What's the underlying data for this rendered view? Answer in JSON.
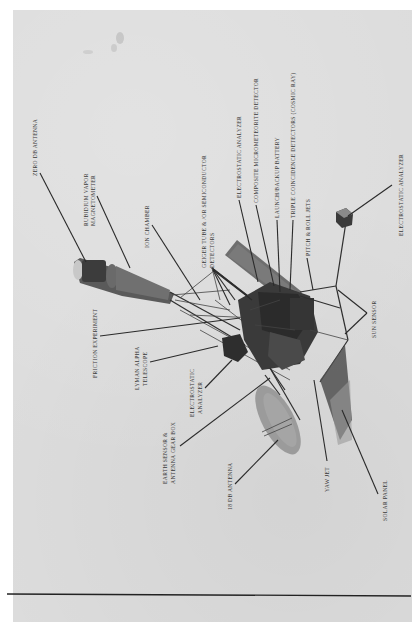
{
  "figure": {
    "orientation": "rotated-90-ccw",
    "labels": [
      {
        "id": "zero-db-antenna",
        "text": "ZERO DB ANTENNA"
      },
      {
        "id": "rubidium-magnetometer",
        "text": "RUBIDIUM VAPOR",
        "text2": "MAGNETOMETER"
      },
      {
        "id": "ion-chamber",
        "text": "ION CHAMBER"
      },
      {
        "id": "geiger-tube",
        "text": "GEIGER TUBE & /OR SEMICONDUCTOR",
        "text2": "DETECTORS"
      },
      {
        "id": "electrostatic-analyzer-1",
        "text": "ELECTROSTATIC ANALYZER"
      },
      {
        "id": "micrometeorite-detector",
        "text": "COMPOSITE MICROMETEORITE DETECTOR"
      },
      {
        "id": "backup-battery",
        "text": "LAUNCH/BACKUP BATTERY"
      },
      {
        "id": "triple-coincidence",
        "text": "TRIPLE COINCIDENCE DETECTORS (COSMIC RAY)"
      },
      {
        "id": "pitch-roll-jets",
        "text": "PITCH & ROLL JETS"
      },
      {
        "id": "electrostatic-analyzer-2",
        "text": "ELECTROSTATIC ANALYZER"
      },
      {
        "id": "sun-sensor",
        "text": "SUN SENSOR"
      },
      {
        "id": "friction-experiment",
        "text": "FRICTION EXPERIMENT"
      },
      {
        "id": "lyman-alpha",
        "text": "LYMAN ALPHA",
        "text2": "TELESCOPE"
      },
      {
        "id": "electrostatic-analyzer-3",
        "text": "ELECTROSTATIC",
        "text2": "ANALYZER"
      },
      {
        "id": "earth-sensor",
        "text": "EARTH SENSOR &",
        "text2": "ANTENNA GEAR BOX"
      },
      {
        "id": "db-antenna-18",
        "text": "18 DB ANTENNA"
      },
      {
        "id": "yaw-jet",
        "text": "YAW JET"
      },
      {
        "id": "solar-panel",
        "text": "SOLAR PANEL"
      }
    ]
  }
}
